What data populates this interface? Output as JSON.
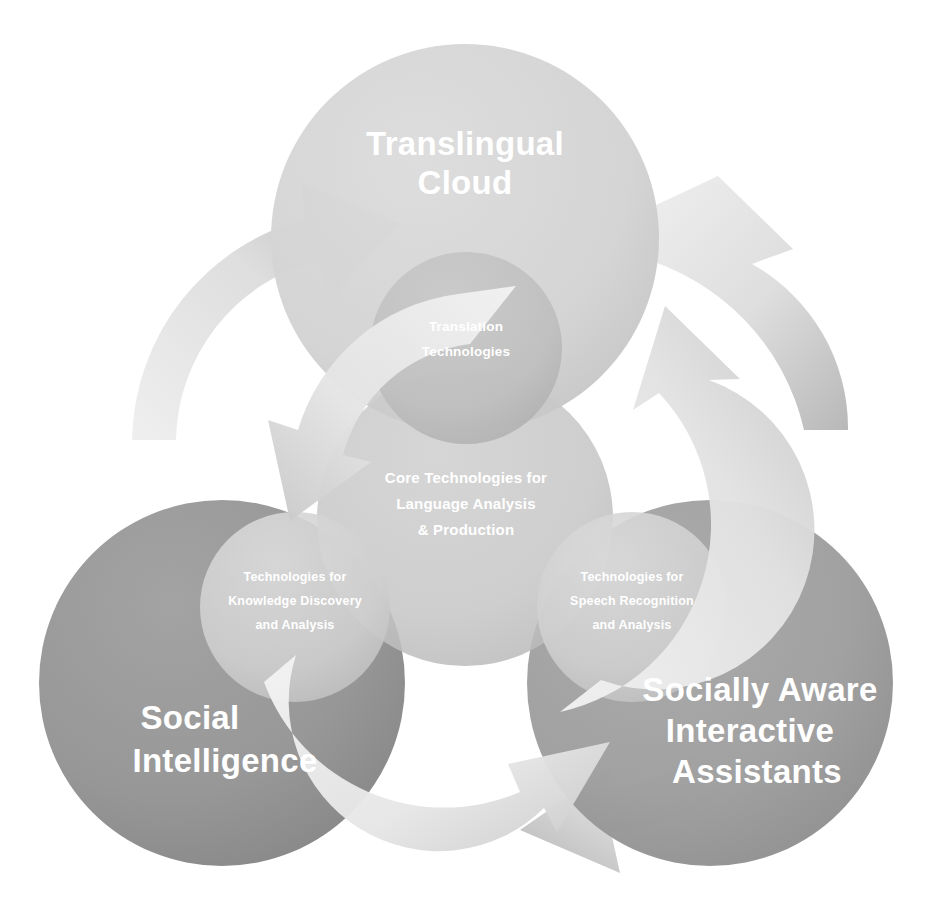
{
  "diagram": {
    "background_color": "#ffffff",
    "pillars": [
      {
        "id": "translingual-cloud",
        "label_line1": "Translingual",
        "label_line2": "Cloud",
        "color": "#d4d4d4",
        "cx": 465,
        "cy": 238,
        "r": 194
      },
      {
        "id": "social-intelligence",
        "label_line1": "Social",
        "label_line2": "Intelligence",
        "color": "#949494",
        "cx": 222,
        "cy": 683,
        "r": 183
      },
      {
        "id": "socially-aware-interactive-assistants",
        "label_line1": "Socially Aware",
        "label_line2": "Interactive",
        "label_line3": "Assistants",
        "color": "#9e9e9e",
        "cx": 710,
        "cy": 683,
        "r": 183
      }
    ],
    "core": {
      "id": "core-technologies",
      "label_line1": "Core Technologies for",
      "label_line2": "Language Analysis",
      "label_line3": "& Production",
      "color": "#c6c6c6",
      "cx": 465,
      "cy": 518,
      "r": 148
    },
    "intersections": [
      {
        "id": "translation-technologies",
        "label_line1": "Translation",
        "label_line2": "Technologies",
        "color": "#bdbdbd",
        "cx": 466,
        "cy": 348,
        "r": 96
      },
      {
        "id": "knowledge-discovery",
        "label_line1": "Technologies for",
        "label_line2": "Knowledge Discovery",
        "label_line3": "and Analysis",
        "color": "#cfcfcf",
        "cx": 295,
        "cy": 607,
        "r": 95
      },
      {
        "id": "speech-recognition",
        "label_line1": "Technologies for",
        "label_line2": "Speech  Recognition",
        "label_line3": "and Analysis",
        "color": "#cfcfcf",
        "cx": 632,
        "cy": 607,
        "r": 95
      }
    ],
    "arrows": [
      {
        "id": "arrow-outer-left-up",
        "direction": "clockwise",
        "color": "#d8d8d8"
      },
      {
        "id": "arrow-inner-left-down",
        "direction": "counterclockwise",
        "color": "#e2e2e2"
      },
      {
        "id": "arrow-outer-right-down",
        "direction": "clockwise",
        "color": "#d8d8d8"
      },
      {
        "id": "arrow-inner-right-up",
        "direction": "counterclockwise",
        "color": "#e2e2e2"
      },
      {
        "id": "arrow-outer-bottom-left",
        "direction": "clockwise",
        "color": "#d8d8d8"
      },
      {
        "id": "arrow-inner-bottom-right",
        "direction": "counterclockwise",
        "color": "#e2e2e2"
      }
    ]
  }
}
